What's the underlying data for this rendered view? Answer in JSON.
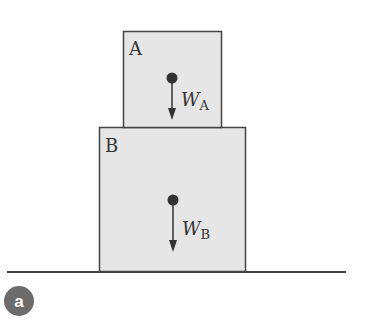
{
  "diagram": {
    "block_a": {
      "label": "A",
      "weight_symbol": "W",
      "weight_subscript": "A"
    },
    "block_b": {
      "label": "B",
      "weight_symbol": "W",
      "weight_subscript": "B"
    },
    "panel_label": "a",
    "colors": {
      "block_fill": "#e6e6e6",
      "outline": "#444444",
      "badge": "#6b6b6b"
    }
  }
}
